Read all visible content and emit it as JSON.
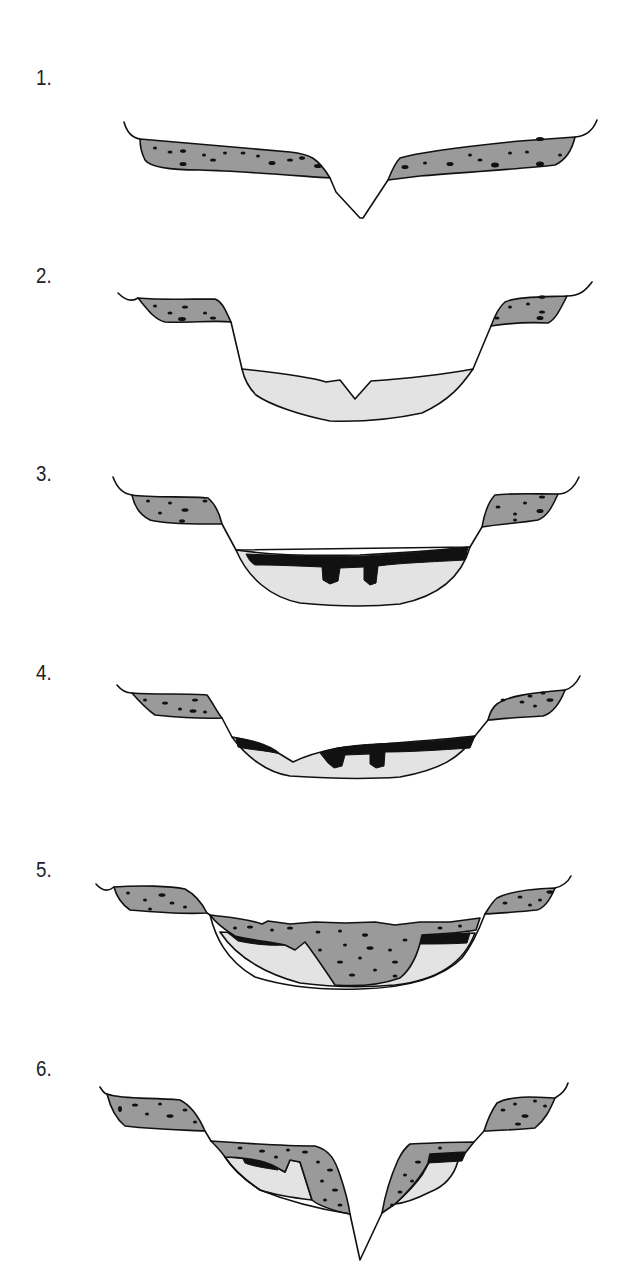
{
  "figure": {
    "panels": [
      {
        "id": "1",
        "label": "1.",
        "description": "V-shaped river valley cut into till plateau"
      },
      {
        "id": "2",
        "label": "2.",
        "description": "Valley widened and filled with sand; small channel in fill"
      },
      {
        "id": "3",
        "label": "3.",
        "description": "Peat layer formed on top of sand fill"
      },
      {
        "id": "4",
        "label": "4.",
        "description": "Channel partly erodes peat and sand fill"
      },
      {
        "id": "5",
        "label": "5.",
        "description": "Valley fill covered and cut by till deposit"
      },
      {
        "id": "6",
        "label": "6.",
        "description": "New V-shaped incision through layered fill"
      }
    ],
    "legend_colors": {
      "till": "#9a9a9a",
      "sand": "#e3e3e3",
      "peat": "#111111",
      "outline": "#111111",
      "background": "#ffffff"
    }
  }
}
